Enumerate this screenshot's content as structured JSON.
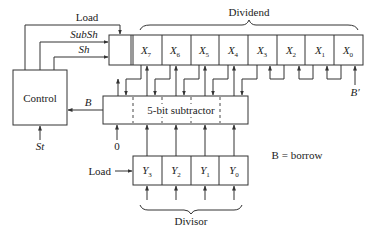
{
  "diagram": {
    "control": {
      "label": "Control"
    },
    "signals": {
      "load": "Load",
      "subsh": "SubSh",
      "sh": "Sh",
      "borrow": "B",
      "start": "St",
      "zero": "0",
      "borrow_bar": "B′",
      "load_divisor": "Load"
    },
    "dividend": {
      "label": "Dividend",
      "cells": [
        {
          "name": "X",
          "sub": "7"
        },
        {
          "name": "X",
          "sub": "6"
        },
        {
          "name": "X",
          "sub": "5"
        },
        {
          "name": "X",
          "sub": "4"
        },
        {
          "name": "X",
          "sub": "3"
        },
        {
          "name": "X",
          "sub": "2"
        },
        {
          "name": "X",
          "sub": "1"
        },
        {
          "name": "X",
          "sub": "0"
        }
      ]
    },
    "subtractor": {
      "label": "5-bit subtractor"
    },
    "divisor": {
      "label": "Divisor",
      "cells": [
        {
          "name": "Y",
          "sub": "3"
        },
        {
          "name": "Y",
          "sub": "2"
        },
        {
          "name": "Y",
          "sub": "1"
        },
        {
          "name": "Y",
          "sub": "0"
        }
      ]
    },
    "legend": {
      "text": "B = borrow"
    }
  }
}
